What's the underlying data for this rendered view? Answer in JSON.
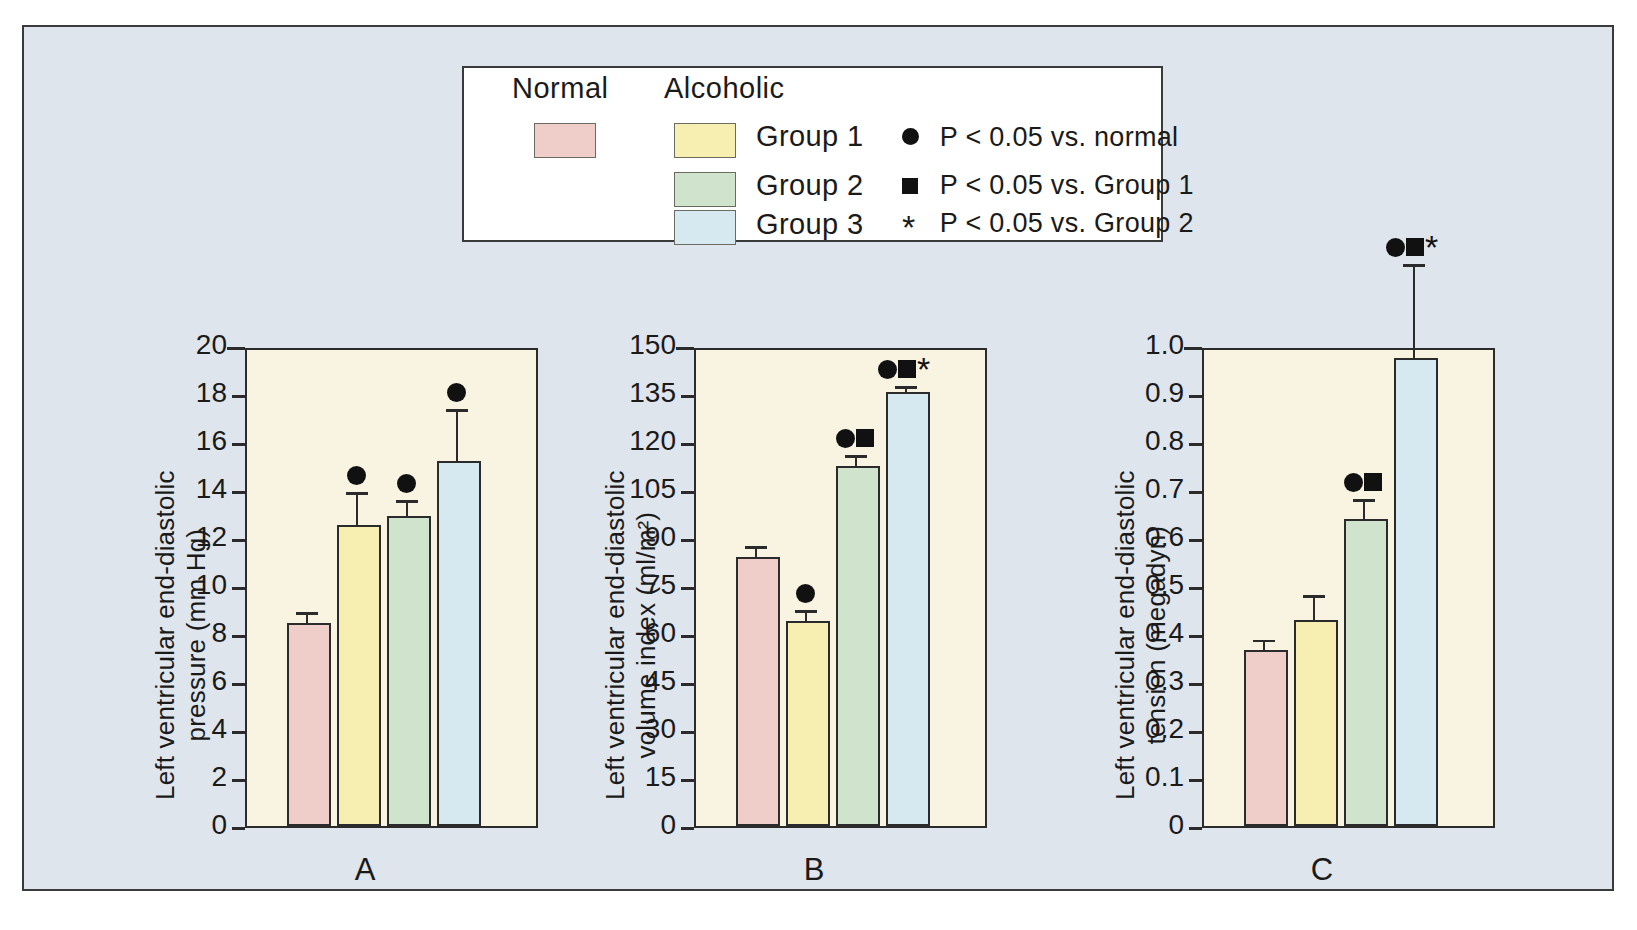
{
  "figure": {
    "background_color": "#dfe5ec",
    "plot_background_color": "#f9f3e2"
  },
  "legend": {
    "normal_title": "Normal",
    "alcoholic_title": "Alcoholic",
    "groups": [
      {
        "label": "Group 1",
        "color": "#f7eeb2"
      },
      {
        "label": "Group 2",
        "color": "#cfe3cd"
      },
      {
        "label": "Group 3",
        "color": "#d6e9f1"
      }
    ],
    "normal_color": "#efcdc8",
    "stats": [
      {
        "marker": "circle",
        "text": "P < 0.05 vs. normal"
      },
      {
        "marker": "square",
        "text": "P < 0.05 vs. Group 1"
      },
      {
        "marker": "asterisk",
        "text": "P < 0.05 vs. Group 2"
      }
    ]
  },
  "chart_data": [
    {
      "type": "bar",
      "panel": "A",
      "title": "",
      "ylabel_line1": "Left ventricular end-diastolic",
      "ylabel_line2": "pressure (mm Hg)",
      "xlabel": "",
      "ylim": [
        0,
        20
      ],
      "yticks": [
        0,
        2,
        4,
        6,
        8,
        10,
        12,
        14,
        16,
        18,
        20
      ],
      "grid": false,
      "categories": [
        "Normal",
        "Group 1",
        "Group 2",
        "Group 3"
      ],
      "values": [
        8.45,
        12.55,
        12.9,
        15.2
      ],
      "errors": [
        0.55,
        1.45,
        0.75,
        2.25
      ],
      "significance": [
        "",
        "circle",
        "circle",
        "circle"
      ],
      "colors": [
        "#efcdc8",
        "#f7eeb2",
        "#cfe3cd",
        "#d6e9f1"
      ]
    },
    {
      "type": "bar",
      "panel": "B",
      "title": "",
      "ylabel_line1": "Left ventricular end-diastolic",
      "ylabel_line2": "volume index (ml/m²)",
      "xlabel": "",
      "ylim": [
        0,
        150
      ],
      "yticks": [
        0,
        15,
        30,
        45,
        60,
        75,
        90,
        105,
        120,
        135,
        150
      ],
      "grid": false,
      "categories": [
        "Normal",
        "Group 1",
        "Group 2",
        "Group 3"
      ],
      "values": [
        84,
        64,
        112.5,
        135.5
      ],
      "errors": [
        4,
        4,
        4,
        2.5
      ],
      "significance": [
        "",
        "circle",
        "circle+square",
        "circle+square+asterisk"
      ],
      "colors": [
        "#efcdc8",
        "#f7eeb2",
        "#cfe3cd",
        "#d6e9f1"
      ]
    },
    {
      "type": "bar",
      "panel": "C",
      "title": "",
      "ylabel_line1": "Left ventricular end-diastolic",
      "ylabel_line2": "tension (megadyn)",
      "xlabel": "",
      "ylim": [
        0,
        1.0
      ],
      "yticks": [
        0,
        0.1,
        0.2,
        0.3,
        0.4,
        0.5,
        0.6,
        0.7,
        0.8,
        0.9,
        1.0
      ],
      "ytick_labels": [
        "0",
        "0.1",
        "0.2",
        "0.3",
        "0.4",
        "0.5",
        "0.6",
        "0.7",
        "0.8",
        "0.9",
        "1.0"
      ],
      "grid": false,
      "categories": [
        "Normal",
        "Group 1",
        "Group 2",
        "Group 3"
      ],
      "values": [
        0.367,
        0.43,
        0.64,
        0.975
      ],
      "errors": [
        0.025,
        0.055,
        0.045,
        0.2
      ],
      "significance": [
        "",
        "",
        "circle+square",
        "circle+square+asterisk"
      ],
      "colors": [
        "#efcdc8",
        "#f7eeb2",
        "#cfe3cd",
        "#d6e9f1"
      ]
    }
  ],
  "panel_letters": [
    "A",
    "B",
    "C"
  ]
}
